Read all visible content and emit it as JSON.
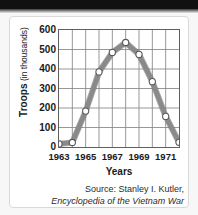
{
  "chart_data": {
    "type": "line",
    "title": "",
    "xlabel": "Years",
    "ylabel": "Troops (in thousands)",
    "ylabel_strong": "Troops",
    "ylabel_light": "(in thousands)",
    "x": [
      1963,
      1964,
      1965,
      1966,
      1967,
      1968,
      1969,
      1970,
      1971,
      1972
    ],
    "values": [
      16,
      23,
      184,
      385,
      485,
      536,
      475,
      335,
      157,
      24
    ],
    "xlim": [
      1963,
      1972
    ],
    "ylim": [
      0,
      600
    ],
    "ytick_labels": [
      "600",
      "500",
      "400",
      "300",
      "200",
      "100",
      "0"
    ],
    "ytick_values": [
      600,
      500,
      400,
      300,
      200,
      100,
      0
    ],
    "xtick_labels": [
      "1963",
      "1965",
      "1967",
      "1969",
      "1971"
    ],
    "xtick_values": [
      1963,
      1965,
      1967,
      1969,
      1971
    ],
    "grid": true,
    "legend": "none",
    "line_color": "#8a8a8a",
    "line_color_dark": "#6e6e6e",
    "marker_fill": "#ffffff",
    "marker_stroke": "#5a5a5a",
    "grid_color": "#8c8c8c",
    "axis_color": "#5f5f5f"
  },
  "source": {
    "line1": "Source: Stanley I. Kutler,",
    "line2": "Encyclopedia of the Vietnam War"
  },
  "colors": {
    "card_background": "#ffffff",
    "card_border": "#d9d9d9",
    "page_background": "#f7f7f7",
    "top_band": "#111111",
    "text": "#1a1a1a"
  }
}
